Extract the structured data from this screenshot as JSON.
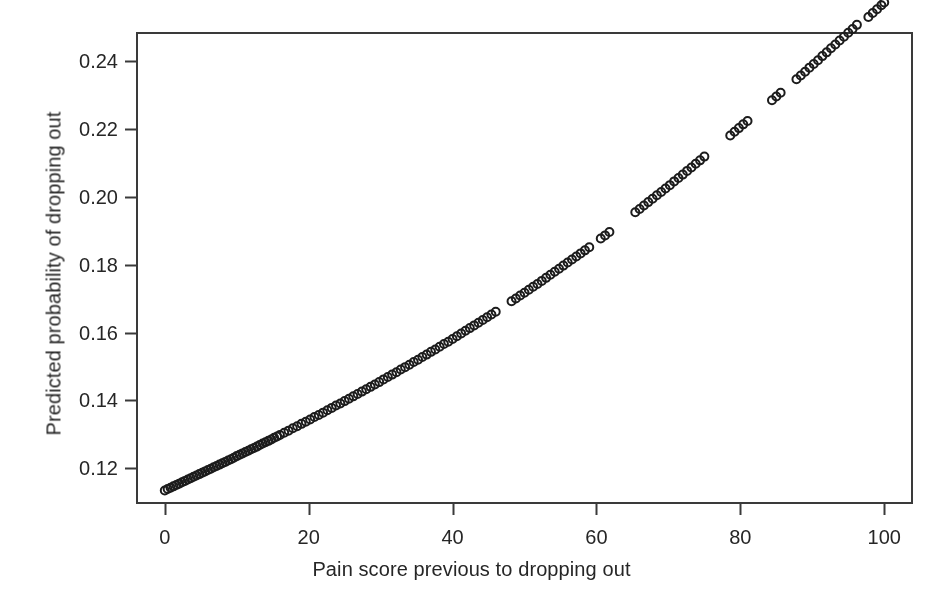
{
  "figure": {
    "background_color": "#ffffff",
    "frame_color": "#3a3a3a",
    "marker_color": "#1c1c1c",
    "text_color": "#262626"
  },
  "chart_data": {
    "type": "scatter",
    "title": "",
    "xlabel": "Pain score previous to dropping out",
    "ylabel": "Predicted probability of dropping out",
    "xlim": [
      -4,
      104
    ],
    "ylim": [
      0.1095,
      0.2485
    ],
    "xticks": [
      0,
      20,
      40,
      60,
      80,
      100
    ],
    "xtick_labels": [
      "0",
      "20",
      "40",
      "60",
      "80",
      "100"
    ],
    "yticks": [
      0.12,
      0.14,
      0.16,
      0.18,
      0.2,
      0.22,
      0.24
    ],
    "ytick_labels": [
      "0.12",
      "0.14",
      "0.16",
      "0.18",
      "0.20",
      "0.22",
      "0.24"
    ],
    "grid": false,
    "legend": null,
    "marker": "open-circle",
    "marker_size_px": 10,
    "marker_stroke_px": 2,
    "series_name": "Predicted dropout probability",
    "x": [
      0,
      0.4,
      0.8,
      1.2,
      1.6,
      2,
      2.4,
      2.8,
      3.2,
      3.6,
      4,
      4.4,
      4.8,
      5.2,
      5.6,
      6,
      6.4,
      6.8,
      7.2,
      7.6,
      8,
      8.4,
      8.8,
      9.2,
      9.6,
      10,
      10.4,
      10.8,
      11.2,
      11.6,
      12,
      12.4,
      12.8,
      13.2,
      13.6,
      14,
      14.4,
      14.8,
      15.2,
      15.6,
      16,
      16.6,
      17.2,
      17.8,
      18.4,
      19,
      19.6,
      20.2,
      20.8,
      21.4,
      22,
      22.6,
      23.2,
      23.8,
      24.4,
      25,
      25.6,
      26.2,
      26.8,
      27.4,
      28,
      28.6,
      29.2,
      29.8,
      30.4,
      31,
      31.6,
      32.2,
      32.8,
      33.4,
      34,
      34.6,
      35.2,
      35.8,
      36.4,
      37,
      37.6,
      38.2,
      38.8,
      39.4,
      40,
      40.6,
      41.2,
      41.8,
      42.4,
      43,
      43.6,
      44.2,
      44.8,
      45.4,
      46,
      48.2,
      48.8,
      49.4,
      50,
      50.6,
      51.2,
      51.8,
      52.4,
      53,
      53.6,
      54.2,
      54.8,
      55.4,
      56,
      56.6,
      57.2,
      57.8,
      58.4,
      59,
      60.6,
      61.2,
      61.8,
      65.4,
      66,
      66.6,
      67.2,
      67.8,
      68.4,
      69,
      69.6,
      70.2,
      70.8,
      71.4,
      72,
      72.6,
      73.2,
      73.8,
      74.4,
      75,
      78.6,
      79.2,
      79.8,
      80.4,
      81,
      84.4,
      85,
      85.6,
      87.8,
      88.4,
      89,
      89.6,
      90.2,
      90.8,
      91.4,
      92,
      92.6,
      93.2,
      93.8,
      94.4,
      95,
      95.6,
      96.2,
      97.8,
      98.4,
      99,
      99.6,
      100
    ],
    "y": [
      0.1135,
      0.1139,
      0.1143,
      0.1147,
      0.1151,
      0.1155,
      0.1159,
      0.1163,
      0.1167,
      0.1171,
      0.1175,
      0.1179,
      0.1183,
      0.1187,
      0.1191,
      0.1195,
      0.1199,
      0.1203,
      0.1207,
      0.1211,
      0.1215,
      0.1219,
      0.1223,
      0.1227,
      0.1231,
      0.1236,
      0.124,
      0.1244,
      0.1248,
      0.1252,
      0.1256,
      0.126,
      0.1264,
      0.1269,
      0.1273,
      0.1277,
      0.1281,
      0.1285,
      0.129,
      0.1294,
      0.1298,
      0.1305,
      0.1311,
      0.1318,
      0.1324,
      0.1331,
      0.1337,
      0.1344,
      0.1351,
      0.1357,
      0.1364,
      0.1371,
      0.1378,
      0.1385,
      0.1391,
      0.1398,
      0.1405,
      0.1412,
      0.1419,
      0.1426,
      0.1433,
      0.144,
      0.1447,
      0.1454,
      0.1462,
      0.1469,
      0.1476,
      0.1483,
      0.1491,
      0.1498,
      0.1505,
      0.1513,
      0.152,
      0.1528,
      0.1535,
      0.1543,
      0.155,
      0.1558,
      0.1566,
      0.1573,
      0.1581,
      0.1589,
      0.1597,
      0.1605,
      0.1613,
      0.1621,
      0.1629,
      0.1637,
      0.1645,
      0.1653,
      0.1661,
      0.1692,
      0.17,
      0.1709,
      0.1717,
      0.1726,
      0.1735,
      0.1743,
      0.1752,
      0.1761,
      0.177,
      0.1779,
      0.1788,
      0.1797,
      0.1806,
      0.1815,
      0.1824,
      0.1833,
      0.1842,
      0.1851,
      0.1877,
      0.1886,
      0.1896,
      0.1954,
      0.1964,
      0.1974,
      0.1984,
      0.1994,
      0.2004,
      0.2014,
      0.2024,
      0.2034,
      0.2045,
      0.2055,
      0.2065,
      0.2076,
      0.2086,
      0.2097,
      0.2107,
      0.2118,
      0.218,
      0.2191,
      0.2202,
      0.2213,
      0.2223,
      0.2284,
      0.2295,
      0.2306,
      0.2346,
      0.2357,
      0.2368,
      0.238,
      0.2391,
      0.2402,
      0.2414,
      0.2425,
      0.2437,
      0.2448,
      0.246,
      0.2471,
      0.2483,
      0.2494,
      0.2506,
      0.2529,
      0.2541,
      0.2552,
      0.2564,
      0.2572
    ]
  }
}
